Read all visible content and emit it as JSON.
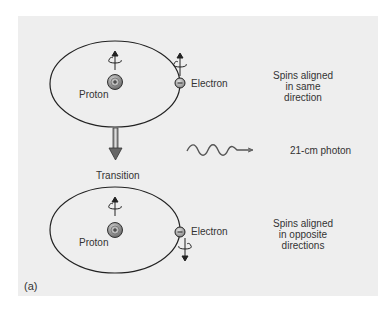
{
  "figure": {
    "panel_label": "(a)",
    "top_state": {
      "proton_label": "Proton",
      "electron_label": "Electron",
      "proton_sign": "+",
      "electron_sign": "−",
      "description_lines": [
        "Spins aligned",
        "in same",
        "direction"
      ],
      "proton_spin": "up",
      "electron_spin": "up"
    },
    "transition": {
      "label": "Transition",
      "arrow": "down-arrow-icon"
    },
    "photon": {
      "label": "21-cm photon",
      "icon": "wavy-photon-icon"
    },
    "bottom_state": {
      "proton_label": "Proton",
      "electron_label": "Electron",
      "proton_sign": "+",
      "electron_sign": "−",
      "description_lines": [
        "Spins aligned",
        "in opposite",
        "directions"
      ],
      "proton_spin": "up",
      "electron_spin": "down"
    },
    "colors": {
      "background": "#eeeeee",
      "line": "#222222",
      "text": "#333333",
      "proton_fill": "#888888",
      "electron_fill": "#aaaaaa"
    }
  }
}
